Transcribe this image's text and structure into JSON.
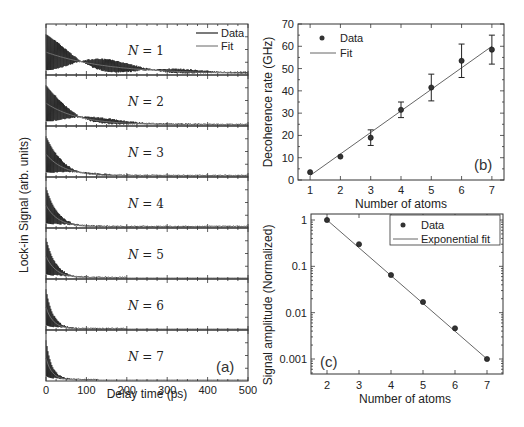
{
  "chart_data": [
    {
      "panel": "(a)",
      "type": "line",
      "xlabel": "Delay time (ps)",
      "ylabel": "Lock-in Signal (arb. units)",
      "xlim": [
        0,
        500
      ],
      "xticks": [
        "0",
        "100",
        "200",
        "300",
        "400",
        "500"
      ],
      "legend": [
        "Data",
        "Fit"
      ],
      "series": [
        {
          "name": "N = 1",
          "label_n": "N",
          "label_val": "= 1",
          "decay_ps": 150,
          "end_ps": 500
        },
        {
          "name": "N = 2",
          "label_n": "N",
          "label_val": "= 2",
          "decay_ps": 80,
          "end_ps": 500
        },
        {
          "name": "N = 3",
          "label_n": "N",
          "label_val": "= 3",
          "decay_ps": 45,
          "end_ps": 500
        },
        {
          "name": "N = 4",
          "label_n": "N",
          "label_val": "= 4",
          "decay_ps": 30,
          "end_ps": 500
        },
        {
          "name": "N = 5",
          "label_n": "N",
          "label_val": "= 5",
          "decay_ps": 25,
          "end_ps": 200
        },
        {
          "name": "N = 6",
          "label_n": "N",
          "label_val": "= 6",
          "decay_ps": 18,
          "end_ps": 200
        },
        {
          "name": "N = 7",
          "label_n": "N",
          "label_val": "= 7",
          "decay_ps": 15,
          "end_ps": 130
        }
      ]
    },
    {
      "panel": "(b)",
      "type": "scatter",
      "xlabel": "Number of atoms",
      "ylabel": "Decoherence rate (GHz)",
      "xlim": [
        0.6,
        7.4
      ],
      "ylim": [
        0,
        70
      ],
      "xticks": [
        "1",
        "2",
        "3",
        "4",
        "5",
        "6",
        "7"
      ],
      "yticks": [
        "0",
        "10",
        "20",
        "30",
        "40",
        "50",
        "60",
        "70"
      ],
      "legend": [
        "Data",
        "Fit"
      ],
      "x": [
        1,
        2,
        3,
        4,
        5,
        6,
        7
      ],
      "series": [
        {
          "name": "Data",
          "values": [
            3.5,
            10.5,
            19,
            31.5,
            41.5,
            53.5,
            58.5
          ],
          "err": [
            1,
            0.8,
            3.5,
            3.5,
            6,
            7.5,
            6.5
          ]
        },
        {
          "name": "Fit",
          "values": [
            2,
            11.7,
            21.3,
            31,
            40.7,
            50.3,
            60
          ]
        }
      ]
    },
    {
      "panel": "(c)",
      "type": "scatter",
      "xlabel": "Number of atoms",
      "ylabel": "Signal amplitude (Normalized)",
      "yscale": "log",
      "xlim": [
        1.5,
        7.5
      ],
      "ylim": [
        0.0004,
        1.5
      ],
      "xticks": [
        "2",
        "3",
        "4",
        "5",
        "6",
        "7"
      ],
      "yticks": [
        "1",
        "0.1",
        "0.01",
        "0.001"
      ],
      "legend": [
        "Data",
        "Exponential fit"
      ],
      "x": [
        2,
        3,
        4,
        5,
        6,
        7
      ],
      "series": [
        {
          "name": "Data",
          "values": [
            1.0,
            0.3,
            0.065,
            0.017,
            0.0046,
            0.001
          ]
        },
        {
          "name": "Exponential fit",
          "values": [
            1.0,
            0.251,
            0.063,
            0.0158,
            0.004,
            0.001
          ]
        }
      ]
    }
  ],
  "labels": {
    "a_xlabel": "Delay time (ps)",
    "a_ylabel": "Lock-in Signal (arb. units)",
    "a_panel": "(a)",
    "a_legend_data": "Data",
    "a_legend_fit": "Fit",
    "b_xlabel": "Number of atoms",
    "b_ylabel": "Decoherence rate (GHz)",
    "b_panel": "(b)",
    "b_legend_data": "Data",
    "b_legend_fit": "Fit",
    "c_xlabel": "Number of atoms",
    "c_ylabel": "Signal amplitude (Normalized)",
    "c_panel": "(c)",
    "c_legend_data": "Data",
    "c_legend_fit": "Exponential fit"
  }
}
